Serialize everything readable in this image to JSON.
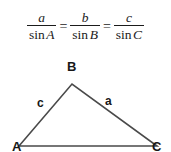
{
  "figure": {
    "formula": {
      "fractions": [
        {
          "numerator": "a",
          "denominator_fn": "sin",
          "denominator_var": "A"
        },
        {
          "numerator": "b",
          "denominator_fn": "sin",
          "denominator_var": "B"
        },
        {
          "numerator": "c",
          "denominator_fn": "sin",
          "denominator_var": "C"
        }
      ],
      "equals": "=",
      "equals_2": "="
    },
    "triangle": {
      "vertices": [
        {
          "name": "A",
          "label": "A",
          "x": 19,
          "y": 91
        },
        {
          "name": "B",
          "label": "B",
          "x": 72,
          "y": 29
        },
        {
          "name": "C",
          "label": "C",
          "x": 157,
          "y": 91
        }
      ],
      "sides": [
        {
          "name": "c",
          "label": "c",
          "between": "A-B"
        },
        {
          "name": "a",
          "label": "a",
          "between": "B-C"
        },
        {
          "name": "b",
          "label": "",
          "between": "A-C"
        }
      ],
      "stroke_color": "#4a4a4a",
      "stroke_width": 1.6
    },
    "colors": {
      "background": "#ffffff",
      "text": "#1b1b1b",
      "label": "#171717",
      "line": "#4a4a4a"
    }
  }
}
